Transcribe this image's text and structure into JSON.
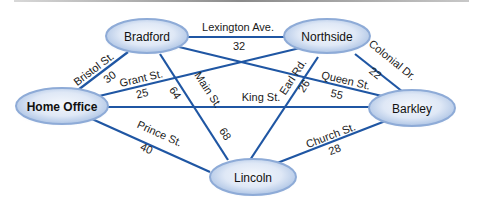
{
  "nodes": {
    "bradford": {
      "label": "Bradford"
    },
    "northside": {
      "label": "Northside"
    },
    "home_office": {
      "label": "Home Office"
    },
    "barkley": {
      "label": "Barkley"
    },
    "lincoln": {
      "label": "Lincoln"
    }
  },
  "edges": {
    "lexington": {
      "street": "Lexington Ave.",
      "weight": "32",
      "from": "Bradford",
      "to": "Northside"
    },
    "bristol": {
      "street": "Bristol St.",
      "weight": "30",
      "from": "Home Office",
      "to": "Bradford"
    },
    "grant": {
      "street": "Grant St.",
      "weight": "25",
      "from": "Home Office",
      "to": "Northside"
    },
    "main": {
      "street": "Main St.",
      "weight_a": "64",
      "weight_b": "68",
      "from": "Bradford",
      "to": "Lincoln"
    },
    "queen": {
      "street": "Queen St.",
      "weight": "55",
      "from": "Bradford",
      "to": "Barkley"
    },
    "earl": {
      "street": "Earl Rd.",
      "weight": "26",
      "from": "Northside",
      "to": "Lincoln"
    },
    "colonial": {
      "street": "Colonial Dr.",
      "weight": "22",
      "from": "Northside",
      "to": "Barkley"
    },
    "king": {
      "street": "King St.",
      "from": "Home Office",
      "to": "Barkley"
    },
    "prince": {
      "street": "Prince St.",
      "weight": "40",
      "from": "Home Office",
      "to": "Lincoln"
    },
    "church": {
      "street": "Church St.",
      "weight": "28",
      "from": "Lincoln",
      "to": "Barkley"
    }
  },
  "colors": {
    "edge": "#1f56a3",
    "node_fill_light": "#eef3fb",
    "node_fill_dark": "#9bb6dc",
    "node_rim": "#7fa0cf"
  }
}
